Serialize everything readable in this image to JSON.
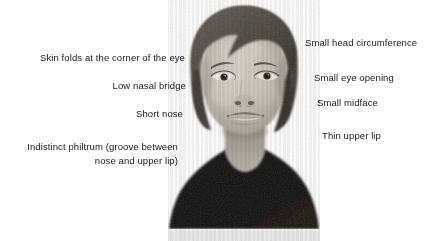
{
  "figure": {
    "background_color": "#ffffff",
    "width": 429,
    "height": 241,
    "text_color": "#1a1a1a"
  },
  "subject_photo": {
    "alt": "Black and white photograph of a child's face and shoulders, front view",
    "skin_color": "#c9c3bb",
    "hair_color": "#4a463f",
    "shirt_color": "#100f0e",
    "baseline_strip_color": "#e8e8e8"
  },
  "annotations": {
    "left": [
      {
        "text": "Skin folds at the corner of the eye"
      },
      {
        "text": "Low nasal bridge"
      },
      {
        "text": "Short nose"
      },
      {
        "text": "Indistinct philtrum (groove between"
      },
      {
        "text": "nose and upper lip)"
      }
    ],
    "right": [
      {
        "text": "Small head circumference"
      },
      {
        "text": "Small eye opening"
      },
      {
        "text": "Small midface"
      },
      {
        "text": "Thin upper lip"
      }
    ]
  }
}
